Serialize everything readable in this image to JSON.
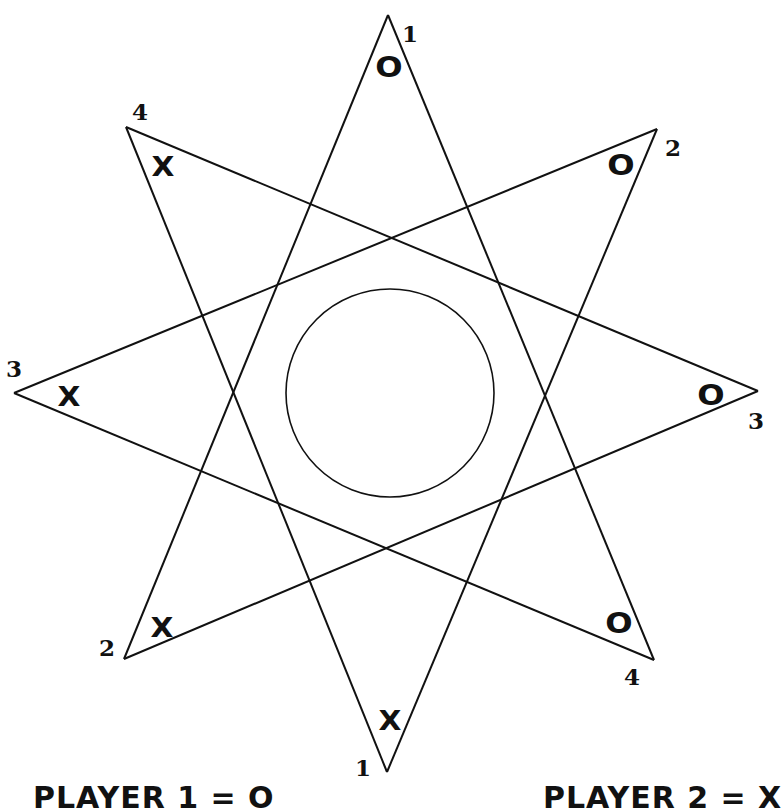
{
  "board": {
    "shape": "eight-pointed star with center circle",
    "line_color": "#111111",
    "background": "#ffffff",
    "center_circle": {
      "cx": 390,
      "cy": 393,
      "r": 104
    },
    "tips": [
      {
        "id": "top",
        "x": 388,
        "y": 15,
        "number": "1",
        "mark": "O"
      },
      {
        "id": "top-right",
        "x": 657,
        "y": 129,
        "number": "2",
        "mark": "O"
      },
      {
        "id": "right",
        "x": 758,
        "y": 391,
        "number": "3",
        "mark": "O"
      },
      {
        "id": "bottom-right",
        "x": 654,
        "y": 660,
        "number": "4",
        "mark": "O"
      },
      {
        "id": "bottom",
        "x": 387,
        "y": 772,
        "number": "1",
        "mark": "X"
      },
      {
        "id": "bottom-left",
        "x": 124,
        "y": 659,
        "number": "2",
        "mark": "X"
      },
      {
        "id": "left",
        "x": 14,
        "y": 393,
        "number": "3",
        "mark": "X"
      },
      {
        "id": "top-left",
        "x": 126,
        "y": 127,
        "number": "4",
        "mark": "X"
      }
    ]
  },
  "labels": {
    "top_number": "1",
    "top_mark": "O",
    "top_right_number": "2",
    "top_right_mark": "O",
    "right_number": "3",
    "right_mark": "O",
    "bottom_right_number": "4",
    "bottom_right_mark": "O",
    "bottom_number": "1",
    "bottom_mark": "X",
    "bottom_left_number": "2",
    "bottom_left_mark": "X",
    "left_number": "3",
    "left_mark": "X",
    "top_left_number": "4",
    "top_left_mark": "X"
  },
  "legend": {
    "player1": "PLAYER 1 = O",
    "player2": "PLAYER 2 = X"
  }
}
